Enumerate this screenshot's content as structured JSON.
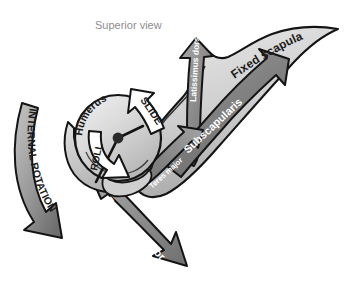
{
  "figure": {
    "title": "Superior view",
    "domain_kind": "anatomical-diagram",
    "background_color": "#ffffff"
  },
  "structures": [
    {
      "id": "humerus",
      "label": "Humerus",
      "label_color": "#1b1b1b",
      "fill_color": "#d5d5d5",
      "outline_color": "#141414"
    },
    {
      "id": "fixed-scapula",
      "label": "Fixed scapula",
      "label_color": "#1b1b1b",
      "fill_color": "#c9c9c9",
      "outline_color": "#141414"
    }
  ],
  "motions": [
    {
      "id": "roll",
      "label": "ROLL",
      "label_color": "#1b1b1b",
      "arrow_fill": "#ffffff",
      "arrow_outline": "#141414"
    },
    {
      "id": "slide",
      "label": "SLIDE",
      "label_color": "#1b1b1b",
      "arrow_fill": "#ffffff",
      "arrow_outline": "#141414"
    },
    {
      "id": "internal-rotation",
      "label": "INTERNAL ROTATION",
      "label_color": "#1b1b1b",
      "arrow_fill": "#9d9d9d",
      "arrow_outline": "#141414"
    }
  ],
  "muscles": [
    {
      "id": "latissimus-dorsi",
      "label": "Latissimus dorsi",
      "label_color": "#ffffff",
      "arrow_fill": "#8c8c8c",
      "arrow_outline": "#141414"
    },
    {
      "id": "subscapularis",
      "label": "Subscapularis",
      "label_color": "#ffffff",
      "arrow_fill": "#7d7d7d",
      "arrow_outline": "#141414"
    },
    {
      "id": "teres-major",
      "label": "Teres major",
      "label_color": "#ffffff",
      "arrow_fill": "#7a7a7a",
      "arrow_outline": "#141414"
    },
    {
      "id": "pectoralis-major",
      "label": "Pectoralis major",
      "label_color": "#ffffff",
      "arrow_fill": "#8a8a8a",
      "arrow_outline": "#141414"
    }
  ]
}
